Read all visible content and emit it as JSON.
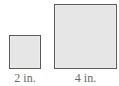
{
  "figure": {
    "shapes": [
      {
        "name": "small-square",
        "side_label": "2 in.",
        "fill": "#e6e6e6",
        "stroke": "#5a5a5a"
      },
      {
        "name": "large-square",
        "side_label": "4 in.",
        "fill": "#e6e6e6",
        "stroke": "#5a5a5a"
      }
    ]
  }
}
